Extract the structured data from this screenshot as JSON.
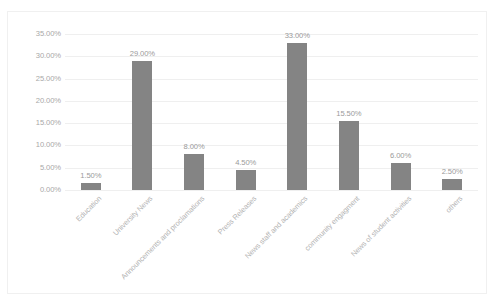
{
  "chart_data": {
    "type": "bar",
    "title": "",
    "xlabel": "",
    "ylabel": "",
    "ylim": [
      0,
      35
    ],
    "ytick_labels": [
      "35.00%",
      "30.00%",
      "25.00%",
      "20.00%",
      "15.00%",
      "10.00%",
      "5.00%",
      "0.00%"
    ],
    "yticks": [
      35,
      30,
      25,
      20,
      15,
      10,
      5,
      0
    ],
    "grid": true,
    "legend": "none",
    "bar_color": "#848484",
    "gridline_color": "#efefef",
    "label_color": "#b3b3b3",
    "categories": [
      "Education",
      "University News",
      "Announcements and proclamations",
      "Press Releases",
      "News staff and academics",
      "community engagment",
      "News of student activities",
      "others"
    ],
    "values": [
      1.5,
      29.0,
      8.0,
      4.5,
      33.0,
      15.5,
      6.0,
      2.5
    ],
    "value_labels": [
      "1.50%",
      "29.00%",
      "8.00%",
      "4.50%",
      "33.00%",
      "15.50%",
      "6.00%",
      "2.50%"
    ]
  }
}
